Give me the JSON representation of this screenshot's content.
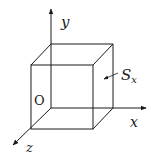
{
  "diagram": {
    "type": "3d-cube-coordinate-axes",
    "labels": {
      "y_axis": "y",
      "x_axis": "x",
      "z_axis": "z",
      "origin": "O",
      "surface": "S",
      "surface_subscript": "x"
    },
    "colors": {
      "line": "#1a1a1a",
      "background": "#ffffff"
    }
  }
}
